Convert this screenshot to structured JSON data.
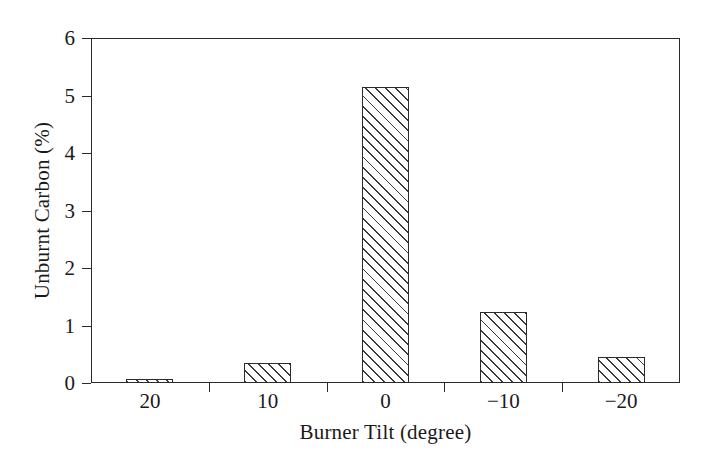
{
  "chart_data": {
    "type": "bar",
    "title": "",
    "xlabel": "Burner Tilt (degree)",
    "ylabel": "Unburnt Carbon (%)",
    "categories": [
      "20",
      "10",
      "0",
      "−10",
      "−20"
    ],
    "values": [
      0.07,
      0.34,
      5.15,
      1.24,
      0.45
    ],
    "ylim": [
      0,
      6
    ],
    "yticks": [
      0,
      1,
      2,
      3,
      4,
      5,
      6
    ],
    "ytick_labels": [
      "0",
      "1",
      "2",
      "3",
      "4",
      "5",
      "6"
    ],
    "grid": false,
    "legend": null,
    "series_style": {
      "fill": "#ffffff",
      "edge_color": "#2b2b2b",
      "hatch": "diagonal-forward-slash"
    }
  },
  "axes": {
    "y_title": "Unburnt Carbon (%)",
    "x_title": "Burner Tilt (degree)",
    "y_labels": [
      "0",
      "1",
      "2",
      "3",
      "4",
      "5",
      "6"
    ],
    "x_labels": [
      "20",
      "10",
      "0",
      "−10",
      "−20"
    ]
  },
  "colors": {
    "axis": "#2b2b2b",
    "hatch": "#3a3a3a",
    "background": "#ffffff"
  }
}
